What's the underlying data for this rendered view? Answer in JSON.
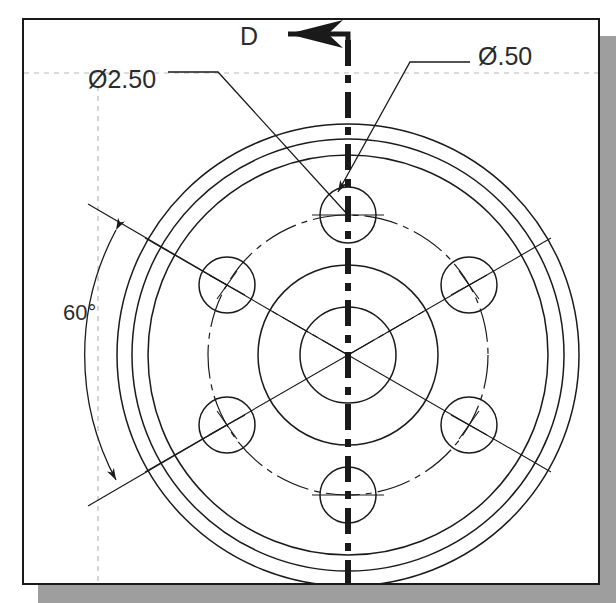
{
  "drawing": {
    "title": "Circular flange front view with bolt circle",
    "type": "engineering-drawing",
    "background_color": "#ffffff",
    "line_color": "#1a1a1a",
    "construction_line_color": "#b4b4b4",
    "shadow_color": "#9e9e9e",
    "panel": {
      "x": 22,
      "y": 18,
      "width": 578,
      "height": 567
    },
    "center": {
      "x": 348,
      "y": 355
    },
    "circles": [
      {
        "name": "outer-rim-circle",
        "radius": 231
      },
      {
        "name": "outer-mid-circle",
        "radius": 216
      },
      {
        "name": "outer-inner-circle",
        "radius": 200
      },
      {
        "name": "hub-outer-circle",
        "radius": 90
      },
      {
        "name": "hub-bore-circle",
        "radius": 48
      }
    ],
    "bolt_circle": {
      "name": "bolt-circle-centerline",
      "radius": 140,
      "hole_count": 6,
      "hole_radius": 28
    },
    "holes": [
      {
        "name": "hole-top",
        "angle_deg": -90
      },
      {
        "name": "hole-upper-right",
        "angle_deg": -30
      },
      {
        "name": "hole-lower-right",
        "angle_deg": 30
      },
      {
        "name": "hole-bottom",
        "angle_deg": 90
      },
      {
        "name": "hole-lower-left",
        "angle_deg": 150
      },
      {
        "name": "hole-upper-left",
        "angle_deg": -150
      }
    ],
    "section_line": {
      "name": "section-line-D",
      "label": "D",
      "orientation": "vertical",
      "x": 348,
      "arrow_direction": "left"
    },
    "dimensions": [
      {
        "name": "bolt-circle-diameter",
        "label": "Ø2.50",
        "text_x": 88,
        "text_y": 88,
        "target": "bolt-circle"
      },
      {
        "name": "hole-diameter",
        "label": "Ø.50",
        "text_x": 478,
        "text_y": 65,
        "target": "hole-top"
      },
      {
        "name": "hole-spacing-angle",
        "label": "60°",
        "text_x": 63,
        "text_y": 320,
        "target": "bolt-circle-angle"
      }
    ]
  }
}
